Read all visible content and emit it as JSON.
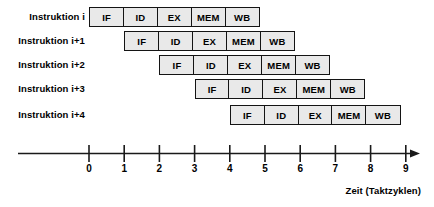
{
  "diagram": {
    "stage_names": [
      "IF",
      "ID",
      "EX",
      "MEM",
      "WB"
    ],
    "rows": [
      {
        "label": "Instruktion i",
        "start_cycle": 0,
        "stages": [
          "IF",
          "ID",
          "EX",
          "MEM",
          "WB"
        ]
      },
      {
        "label": "Instruktion i+1",
        "start_cycle": 1,
        "stages": [
          "IF",
          "ID",
          "EX",
          "MEM",
          "WB"
        ]
      },
      {
        "label": "Instruktion i+2",
        "start_cycle": 2,
        "stages": [
          "IF",
          "ID",
          "EX",
          "MEM",
          "WB"
        ]
      },
      {
        "label": "Instruktion i+3",
        "start_cycle": 3,
        "stages": [
          "IF",
          "ID",
          "EX",
          "MEM",
          "WB"
        ]
      },
      {
        "label": "Instruktion i+4",
        "start_cycle": 4,
        "stages": [
          "IF",
          "ID",
          "EX",
          "MEM",
          "WB"
        ]
      }
    ],
    "axis": {
      "caption": "Zeit (Taktzyklen)",
      "ticks": [
        "0",
        "1",
        "2",
        "3",
        "4",
        "5",
        "6",
        "7",
        "8",
        "9"
      ],
      "min": 0,
      "max": 9,
      "arrow": true
    },
    "colors": {
      "box_fill": "#e9e9e9",
      "box_border": "#141414",
      "text": "#000000",
      "axis": "#1a1a1a",
      "background": "#ffffff"
    }
  },
  "chart_data": {
    "type": "table",
    "xlabel": "Zeit (Taktzyklen)",
    "ylabel": "",
    "xlim": [
      0,
      9
    ],
    "grid": false,
    "categories": [
      "Instruktion i",
      "Instruktion i+1",
      "Instruktion i+2",
      "Instruktion i+3",
      "Instruktion i+4"
    ],
    "series": [
      {
        "name": "IF",
        "values": [
          0,
          1,
          2,
          3,
          4
        ]
      },
      {
        "name": "ID",
        "values": [
          1,
          2,
          3,
          4,
          5
        ]
      },
      {
        "name": "EX",
        "values": [
          2,
          3,
          4,
          5,
          6
        ]
      },
      {
        "name": "MEM",
        "values": [
          3,
          4,
          5,
          6,
          7
        ]
      },
      {
        "name": "WB",
        "values": [
          4,
          5,
          6,
          7,
          8
        ]
      }
    ],
    "tick_labels": [
      "0",
      "1",
      "2",
      "3",
      "4",
      "5",
      "6",
      "7",
      "8",
      "9"
    ]
  }
}
